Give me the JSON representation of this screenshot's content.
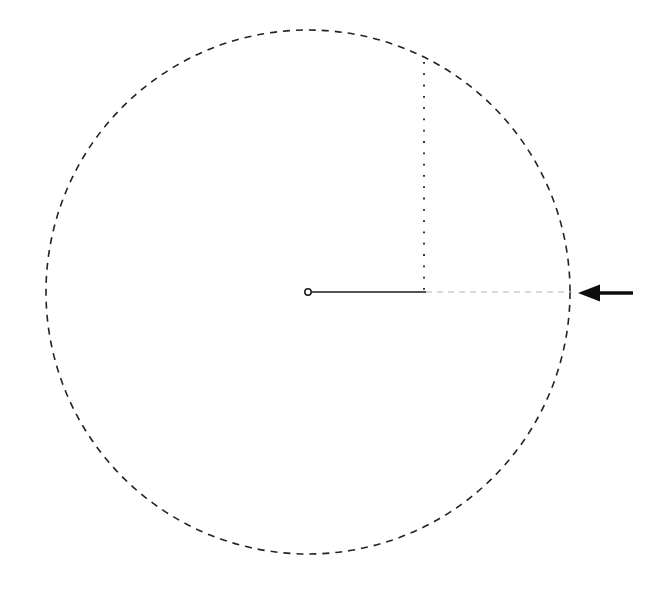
{
  "figure": {
    "background_color": "#ffffff",
    "width": 661,
    "height": 594
  },
  "chart_data": {
    "type": "diagram",
    "title": "",
    "xlabel": "",
    "ylabel": "",
    "grid": false,
    "legend": "none",
    "canvas": {
      "width": 661,
      "height": 594
    },
    "elements": [
      {
        "name": "circle-outline",
        "kind": "circle",
        "cx": 308,
        "cy": 292,
        "r": 262,
        "stroke": "#22222a",
        "stroke_width": 1.6,
        "dash": "7 6",
        "fill": "none",
        "bbox": {
          "x_min": 46,
          "x_max": 570,
          "y_min": 30,
          "y_max": 554
        }
      },
      {
        "name": "center-marker",
        "kind": "point",
        "cx": 308,
        "cy": 292,
        "r": 3.2,
        "stroke": "#1a1a1a",
        "stroke_width": 1.5,
        "fill": "#ffffff",
        "style": "open-circle"
      },
      {
        "name": "radius-solid-segment",
        "kind": "line",
        "x1": 309,
        "y1": 292,
        "x2": 426,
        "y2": 292,
        "stroke": "#1a1a1a",
        "stroke_width": 1.5,
        "dash": "none"
      },
      {
        "name": "radius-dashed-extension",
        "kind": "line",
        "x1": 426,
        "y1": 292,
        "x2": 572,
        "y2": 292,
        "stroke": "#b4b4b8",
        "stroke_width": 1.2,
        "dash": "6 5"
      },
      {
        "name": "vertical-dotted-drop",
        "kind": "line",
        "x1": 424,
        "y1": 62,
        "x2": 424,
        "y2": 291,
        "stroke": "#1a1a1a",
        "stroke_width": 1.8,
        "dash": "1.8 9.5"
      },
      {
        "name": "pointer-arrow",
        "kind": "arrow",
        "direction": "left",
        "tip_x": 578,
        "tip_y": 293,
        "tail_x": 633,
        "tail_y": 293,
        "shaft_width": 3.4,
        "head_length": 22,
        "head_width": 17,
        "color": "#0d0d0d"
      }
    ],
    "annotations": []
  },
  "colors": {
    "stroke_dark": "#22222a",
    "stroke_black": "#1a1a1a",
    "stroke_gray": "#b4b4b8",
    "arrow": "#0d0d0d",
    "background": "#ffffff"
  }
}
